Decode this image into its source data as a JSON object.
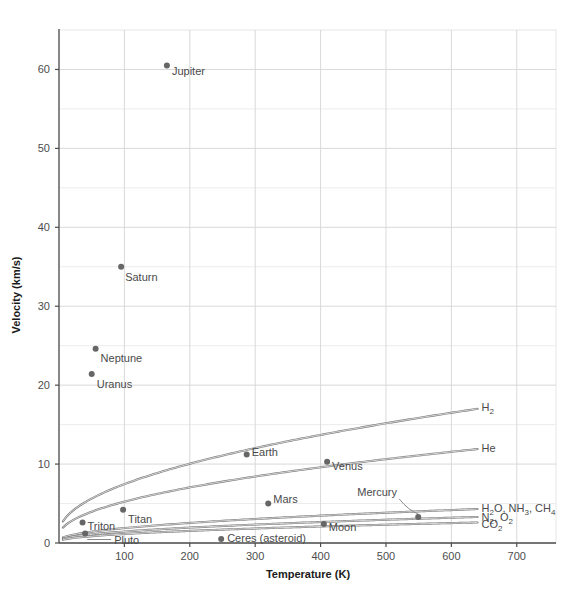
{
  "chart_data": {
    "type": "scatter",
    "title": "",
    "xlabel": "Temperature (K)",
    "ylabel": "Velocity (km/s)",
    "xlim": [
      0,
      760
    ],
    "ylim": [
      0,
      65
    ],
    "xticks": [
      100,
      200,
      300,
      400,
      500,
      600,
      700
    ],
    "yticks": [
      0,
      10,
      20,
      30,
      40,
      50,
      60
    ],
    "y_minor_gridlines": [
      5,
      15,
      25,
      35,
      45,
      55
    ],
    "grid": true,
    "legend_position": "inline-curve-labels",
    "accent_color": "#666666",
    "grid_color": "#d9d9d9",
    "axis_color": "#4d4d4d",
    "points": [
      {
        "name": "Jupiter",
        "x": 165,
        "y": 60.5,
        "label_dx": 5,
        "label_dy": 5,
        "anchor": "start"
      },
      {
        "name": "Saturn",
        "x": 95,
        "y": 35.0,
        "label_dx": 4,
        "label_dy": 10,
        "anchor": "start"
      },
      {
        "name": "Neptune",
        "x": 56,
        "y": 24.6,
        "label_dx": 5,
        "label_dy": 9,
        "anchor": "start"
      },
      {
        "name": "Uranus",
        "x": 50,
        "y": 21.4,
        "label_dx": 5,
        "label_dy": 10,
        "anchor": "start"
      },
      {
        "name": "Earth",
        "x": 287,
        "y": 11.2,
        "label_dx": 5,
        "label_dy": -3,
        "anchor": "start"
      },
      {
        "name": "Venus",
        "x": 410,
        "y": 10.3,
        "label_dx": 5,
        "label_dy": 4,
        "anchor": "start"
      },
      {
        "name": "Mars",
        "x": 320,
        "y": 5.0,
        "label_dx": 5,
        "label_dy": -5,
        "anchor": "start"
      },
      {
        "name": "Titan",
        "x": 98,
        "y": 4.2,
        "label_dx": 5,
        "label_dy": 9,
        "anchor": "start"
      },
      {
        "name": "Triton",
        "x": 36,
        "y": 2.6,
        "label_dx": 5,
        "label_dy": 4,
        "anchor": "start"
      },
      {
        "name": "Moon",
        "x": 405,
        "y": 2.4,
        "label_dx": 5,
        "label_dy": 3,
        "anchor": "start"
      },
      {
        "name": "Ceres (asteroid)",
        "x": 248,
        "y": 0.5,
        "label_dx": 6,
        "label_dy": -1,
        "anchor": "start"
      },
      {
        "name": "Pluto",
        "x": 40,
        "y": 1.2,
        "label_dx": 0,
        "label_dy": 0,
        "anchor": "start"
      },
      {
        "name": "Mercury",
        "x": 560,
        "y": 3.3,
        "label_dx": 0,
        "label_dy": 0,
        "anchor": "start"
      }
    ],
    "curves": [
      {
        "id": "h2",
        "label": "H2",
        "label_parts": [
          {
            "t": "H"
          },
          {
            "t": "2",
            "sub": true
          }
        ],
        "v_end": 17.0,
        "t_start": 6,
        "v_start": 2.75,
        "t_end": 640,
        "label_y": 17.2
      },
      {
        "id": "he",
        "label": "He",
        "label_parts": [
          {
            "t": "He"
          }
        ],
        "v_end": 11.9,
        "t_start": 6,
        "v_start": 1.95,
        "t_end": 640,
        "label_y": 12.0
      },
      {
        "id": "heavy",
        "label": "H2O, NH3, CH4",
        "label_parts": [
          {
            "t": "H"
          },
          {
            "t": "2",
            "sub": true
          },
          {
            "t": "O, NH"
          },
          {
            "t": "3",
            "sub": true
          },
          {
            "t": ", CH"
          },
          {
            "t": "4",
            "sub": true
          }
        ],
        "v_end": 4.3,
        "t_start": 6,
        "v_start": 0.7,
        "t_end": 640,
        "label_y": 4.45
      },
      {
        "id": "n2o2",
        "label": "N2, O2",
        "label_parts": [
          {
            "t": "N"
          },
          {
            "t": "2",
            "sub": true
          },
          {
            "t": ", O"
          },
          {
            "t": "2",
            "sub": true
          }
        ],
        "v_end": 3.3,
        "t_start": 6,
        "v_start": 0.54,
        "t_end": 640,
        "label_y": 3.35
      },
      {
        "id": "co2",
        "label": "CO2",
        "label_parts": [
          {
            "t": "CO"
          },
          {
            "t": "2",
            "sub": true
          }
        ],
        "v_end": 2.6,
        "t_start": 6,
        "v_start": 0.42,
        "t_end": 640,
        "label_y": 2.45
      }
    ],
    "annotations": [
      {
        "name": "mercury-leader",
        "label": "Mercury",
        "from_x": 520,
        "from_y": 5.6,
        "to_x": 561,
        "to_y": 3.55
      }
    ]
  }
}
